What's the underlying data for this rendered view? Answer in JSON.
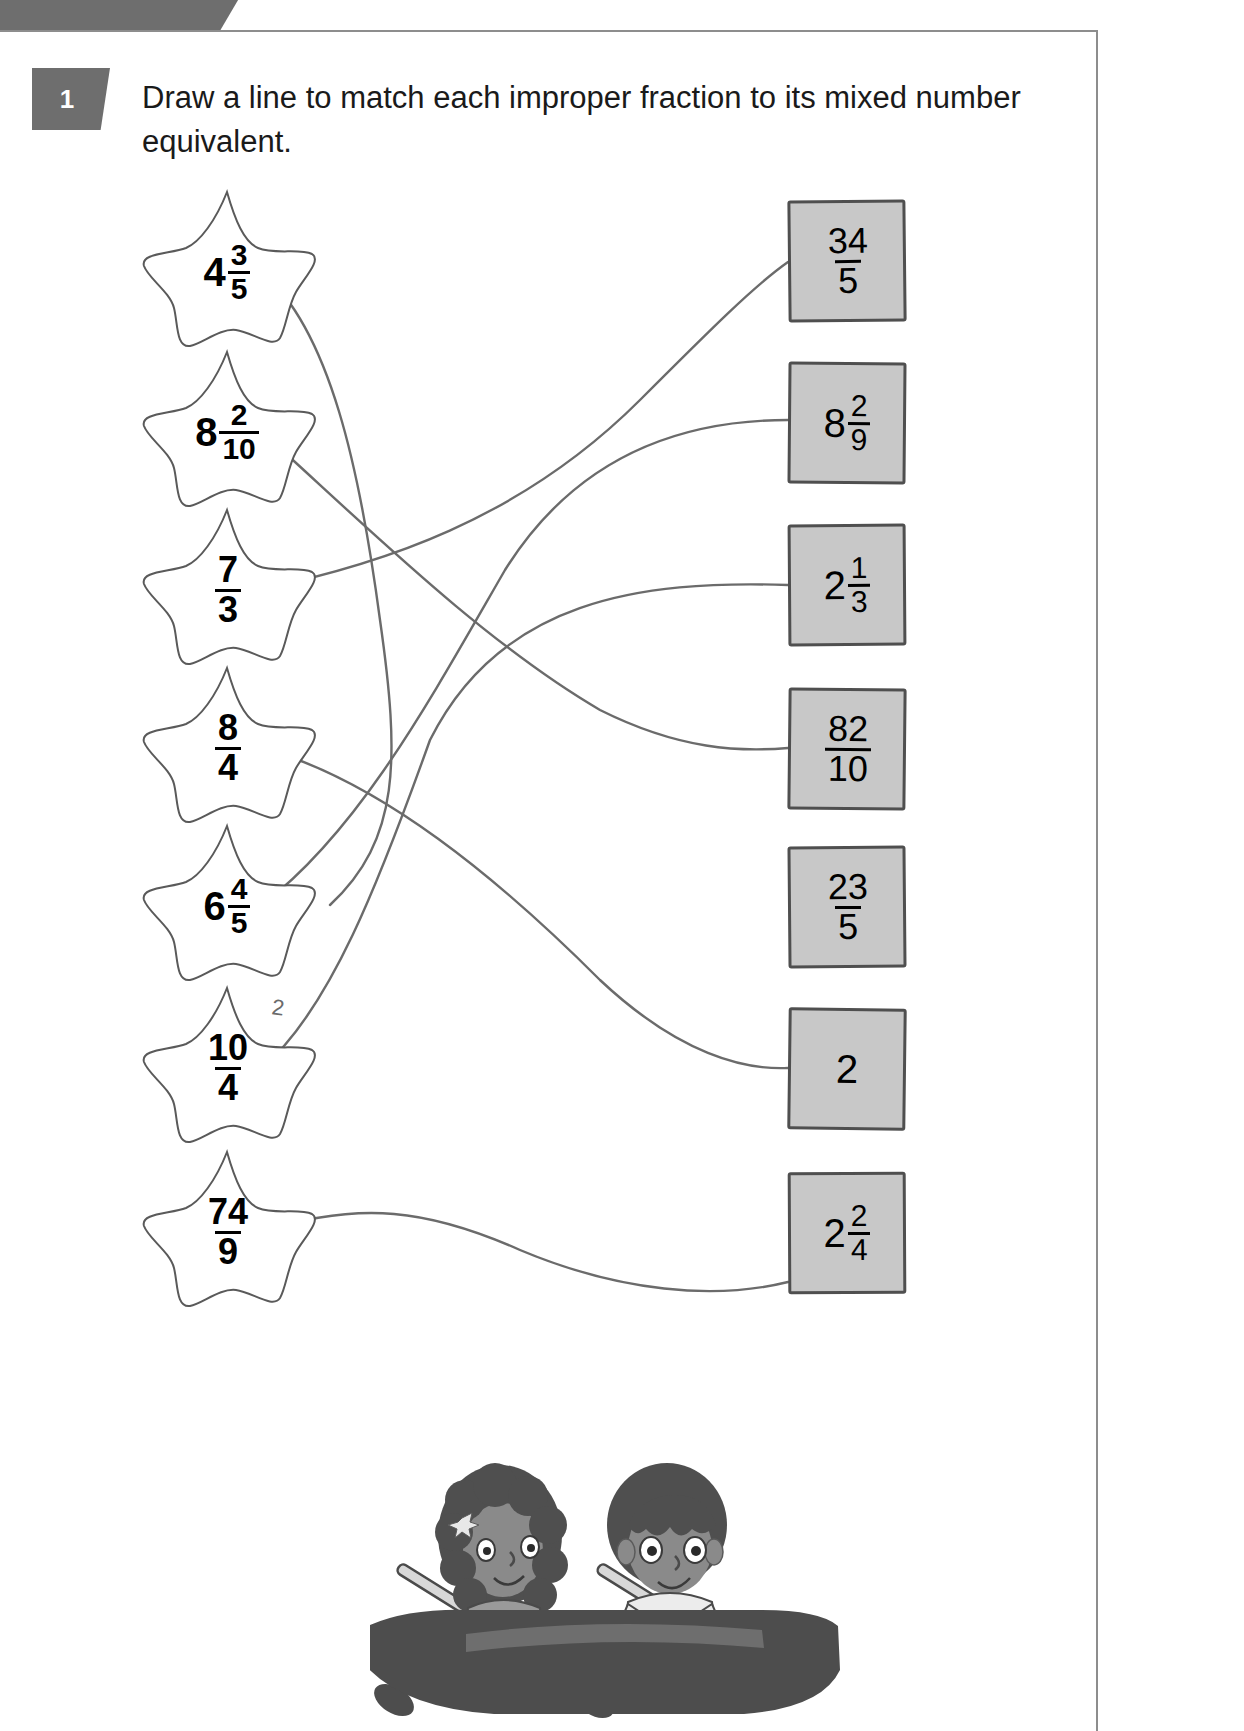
{
  "header": {
    "challenge_label": "Challenge 1"
  },
  "question": {
    "number": "1",
    "instruction": "Draw a line to match each improper fraction to its mixed number equivalent."
  },
  "stars": [
    {
      "id": "star-1",
      "whole": "4",
      "num": "3",
      "den": "5",
      "type": "mixed"
    },
    {
      "id": "star-2",
      "whole": "8",
      "num": "2",
      "den": "10",
      "type": "mixed"
    },
    {
      "id": "star-3",
      "whole": "",
      "num": "7",
      "den": "3",
      "type": "fraction"
    },
    {
      "id": "star-4",
      "whole": "",
      "num": "8",
      "den": "4",
      "type": "fraction"
    },
    {
      "id": "star-5",
      "whole": "6",
      "num": "4",
      "den": "5",
      "type": "mixed"
    },
    {
      "id": "star-6",
      "whole": "",
      "num": "10",
      "den": "4",
      "type": "fraction"
    },
    {
      "id": "star-7",
      "whole": "",
      "num": "74",
      "den": "9",
      "type": "fraction"
    }
  ],
  "boxes": [
    {
      "id": "box-1",
      "whole": "",
      "num": "34",
      "den": "5",
      "type": "fraction"
    },
    {
      "id": "box-2",
      "whole": "8",
      "num": "2",
      "den": "9",
      "type": "mixed"
    },
    {
      "id": "box-3",
      "whole": "2",
      "num": "1",
      "den": "3",
      "type": "mixed"
    },
    {
      "id": "box-4",
      "whole": "",
      "num": "82",
      "den": "10",
      "type": "fraction"
    },
    {
      "id": "box-5",
      "whole": "",
      "num": "23",
      "den": "5",
      "type": "fraction"
    },
    {
      "id": "box-6",
      "whole": "2",
      "num": "",
      "den": "",
      "type": "whole"
    },
    {
      "id": "box-7",
      "whole": "2",
      "num": "2",
      "den": "4",
      "type": "mixed"
    }
  ],
  "doodle": {
    "mark": "2"
  },
  "illustration": {
    "caption": "two children rowing a boat"
  },
  "colors": {
    "tab_gray": "#6e6e6e",
    "box_fill": "#c8c8c8",
    "box_border": "#4f4f4f",
    "line_gray": "#6b6b6b",
    "text": "#1a1a1a"
  }
}
